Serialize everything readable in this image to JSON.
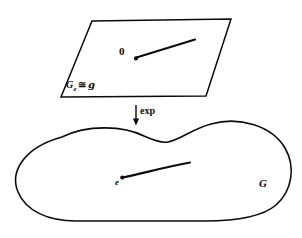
{
  "figure": {
    "ink_color": "#0b0b0b",
    "background_color": "#ffffff",
    "width": 302,
    "height": 238
  },
  "tangent_plane": {
    "name": "tangent-plane-parallelogram",
    "label_main": "G",
    "label_subscript": "e",
    "label_iso_symbol": "≅",
    "label_algebra": "g",
    "origin_label": "0"
  },
  "arrow": {
    "name": "exp-arrow",
    "label": "exp",
    "direction": "down"
  },
  "group_blob": {
    "name": "lie-group-blob",
    "label": "G",
    "identity_label": "e"
  }
}
